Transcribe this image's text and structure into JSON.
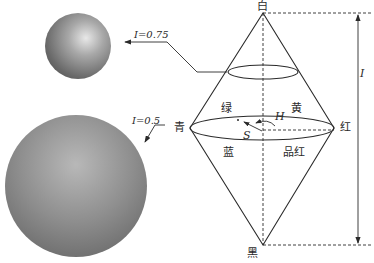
{
  "figure": {
    "vertices": {
      "top": "白",
      "bottom": "黑",
      "left": "青",
      "right": "红"
    },
    "hue_labels": {
      "upper_left": "绿",
      "upper_right": "黄",
      "lower_left": "蓝",
      "lower_right": "品红"
    },
    "symbols": {
      "hue": "H",
      "saturation": "S",
      "intensity_axis": "I"
    },
    "slices": [
      {
        "label": "I=0.75",
        "sphere": "small-upper"
      },
      {
        "label": "I=0.5",
        "sphere": "large-lower"
      }
    ]
  },
  "colors": {
    "line": "#2a2a2a",
    "sphere_light": "#d8d8d8",
    "sphere_mid": "#9a9a9a",
    "sphere_dark": "#555555",
    "background": "#ffffff"
  }
}
